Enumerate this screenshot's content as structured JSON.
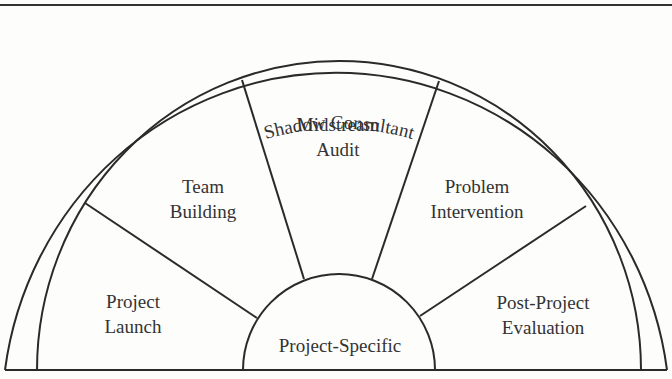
{
  "diagram": {
    "outer_ring_label": "Shadow Consultant",
    "hub_label": "Project-Specific",
    "segments": [
      {
        "line1": "Project",
        "line2": "Launch"
      },
      {
        "line1": "Team",
        "line2": "Building"
      },
      {
        "line1": "Midstream",
        "line2": "Audit"
      },
      {
        "line1": "Problem",
        "line2": "Intervention"
      },
      {
        "line1": "Post-Project",
        "line2": "Evaluation"
      }
    ]
  },
  "colors": {
    "stroke": "#2a2a2a",
    "text": "#333333",
    "background": "#fdfdfc"
  }
}
